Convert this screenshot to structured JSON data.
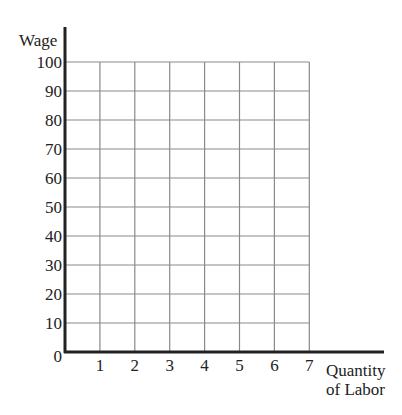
{
  "chart_data": {
    "type": "line",
    "title": "",
    "xlabel": "Quantity of Labor",
    "xlabel_lines": [
      "Quantity",
      "of Labor"
    ],
    "ylabel": "Wage",
    "x_ticks": [
      "1",
      "2",
      "3",
      "4",
      "5",
      "6",
      "7"
    ],
    "y_ticks": [
      "0",
      "10",
      "20",
      "30",
      "40",
      "50",
      "60",
      "70",
      "80",
      "90",
      "100"
    ],
    "xlim": [
      0,
      7
    ],
    "ylim": [
      0,
      100
    ],
    "grid": true,
    "series": []
  }
}
